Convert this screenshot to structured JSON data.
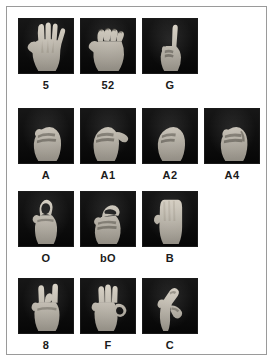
{
  "figure": {
    "frame_border_color": "#9a9a9a",
    "background_color": "#ffffff",
    "photo_background_color": "#0a0a0a",
    "hand_color": "#e8e2d8",
    "label_color": "#1b1b1b"
  },
  "rows": [
    {
      "row_name": "row-1",
      "cells": [
        {
          "label": "5",
          "icon": "hand-open-palm-spread-icon",
          "description": "open hand, all five fingers extended and spread"
        },
        {
          "label": "52",
          "icon": "hand-open-palm-bent-fingers-icon",
          "description": "open hand with fingers bent at knuckles"
        },
        {
          "label": "G",
          "icon": "hand-index-finger-extended-icon",
          "description": "fist with index finger pointing up"
        }
      ]
    },
    {
      "row_name": "row-2",
      "cells": [
        {
          "label": "A",
          "icon": "hand-fist-icon",
          "description": "closed fist, thumb alongside"
        },
        {
          "label": "A1",
          "icon": "hand-fist-thumb-out-icon",
          "description": "closed fist with thumb extended sideways"
        },
        {
          "label": "A2",
          "icon": "hand-fist-thumb-across-icon",
          "description": "closed fist with thumb across fingers"
        },
        {
          "label": "A4",
          "icon": "hand-fist-thumb-tucked-icon",
          "description": "closed fist with thumb tucked"
        }
      ]
    },
    {
      "row_name": "row-3",
      "cells": [
        {
          "label": "O",
          "icon": "hand-o-shape-icon",
          "description": "fingers and thumb forming a circle"
        },
        {
          "label": "bO",
          "icon": "hand-flattened-o-icon",
          "description": "flattened O, fingertips meeting thumb"
        },
        {
          "label": "B",
          "icon": "hand-flat-palm-icon",
          "description": "flat hand, fingers together, thumb across palm"
        }
      ]
    },
    {
      "row_name": "row-4",
      "cells": [
        {
          "label": "8",
          "icon": "hand-middle-finger-bent-icon",
          "description": "middle finger bent to thumb, others extended"
        },
        {
          "label": "F",
          "icon": "hand-ok-sign-icon",
          "description": "index and thumb touching, three fingers extended"
        },
        {
          "label": "C",
          "icon": "hand-c-shape-icon",
          "description": "hand curved into a C shape"
        }
      ]
    }
  ]
}
